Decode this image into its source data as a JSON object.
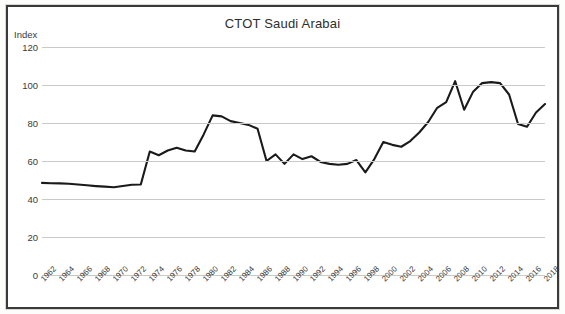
{
  "chart_data": {
    "type": "line",
    "title": "CTOT Saudi Arabai",
    "xlabel": "",
    "ylabel": "Index",
    "ylim": [
      0,
      120
    ],
    "yticks": [
      0,
      20,
      40,
      60,
      80,
      100,
      120
    ],
    "xlim": [
      1962,
      2018
    ],
    "grid": true,
    "legend": "none",
    "series_color": "#1a1a1a",
    "grid_color": "#c9c9c6",
    "x": [
      1962,
      1963,
      1964,
      1965,
      1966,
      1967,
      1968,
      1969,
      1970,
      1971,
      1972,
      1973,
      1974,
      1975,
      1976,
      1977,
      1978,
      1979,
      1980,
      1981,
      1982,
      1983,
      1984,
      1985,
      1986,
      1987,
      1988,
      1989,
      1990,
      1991,
      1992,
      1993,
      1994,
      1995,
      1996,
      1997,
      1998,
      1999,
      2000,
      2001,
      2002,
      2003,
      2004,
      2005,
      2006,
      2007,
      2008,
      2009,
      2010,
      2011,
      2012,
      2013,
      2014,
      2015,
      2016,
      2017,
      2018
    ],
    "values": [
      48.5,
      48.3,
      48.2,
      48.0,
      47.6,
      47.2,
      46.8,
      46.5,
      46.2,
      46.8,
      47.5,
      47.6,
      65.0,
      63.0,
      65.5,
      67.0,
      65.5,
      65.0,
      74.0,
      84.0,
      83.5,
      81.0,
      80.0,
      79.0,
      77.0,
      60.0,
      63.5,
      58.5,
      63.5,
      61.0,
      62.5,
      59.5,
      58.5,
      58.0,
      58.5,
      60.5,
      54.0,
      61.0,
      70.0,
      68.5,
      67.5,
      70.5,
      75.0,
      80.5,
      88.0,
      91.0,
      102.0,
      87.0,
      96.5,
      101.0,
      101.5,
      101.0,
      95.0,
      79.5,
      78.0,
      85.5,
      90.0
    ],
    "xtick_labels": [
      "1962",
      "1964",
      "1966",
      "1968",
      "1970",
      "1972",
      "1974",
      "1976",
      "1978",
      "1980",
      "1982",
      "1984",
      "1986",
      "1988",
      "1990",
      "1992",
      "1994",
      "1996",
      "1998",
      "2000",
      "2002",
      "2004",
      "2006",
      "2008",
      "2010",
      "2012",
      "2014",
      "2016",
      "2018"
    ]
  }
}
